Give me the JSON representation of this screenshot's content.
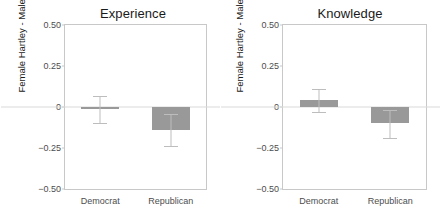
{
  "chart_data": {
    "type": "bar",
    "title": "",
    "xlabel": "",
    "ylabel": "Female Hartley - Male Hartley",
    "ylim": [
      -0.5,
      0.5
    ],
    "yticks": [
      0.5,
      0.25,
      0,
      -0.25,
      -0.5
    ],
    "ytick_labels": [
      "0.50",
      "0.25",
      "0",
      "−0.25",
      "−0.50"
    ],
    "grid": false,
    "legend": "none",
    "zero_reference_line": 0,
    "categories": [
      "Democrat",
      "Republican"
    ],
    "bar_color": "#999999",
    "errorbar_color": "#bdbdbd",
    "panel_border_color": "#c8c8c8",
    "panels": [
      {
        "title": "Experience",
        "values": [
          -0.01,
          -0.14
        ],
        "err_low": [
          -0.1,
          -0.24
        ],
        "err_high": [
          0.07,
          -0.04
        ]
      },
      {
        "title": "Knowledge",
        "values": [
          0.04,
          -0.1
        ],
        "err_low": [
          -0.03,
          -0.19
        ],
        "err_high": [
          0.11,
          -0.02
        ]
      }
    ]
  }
}
